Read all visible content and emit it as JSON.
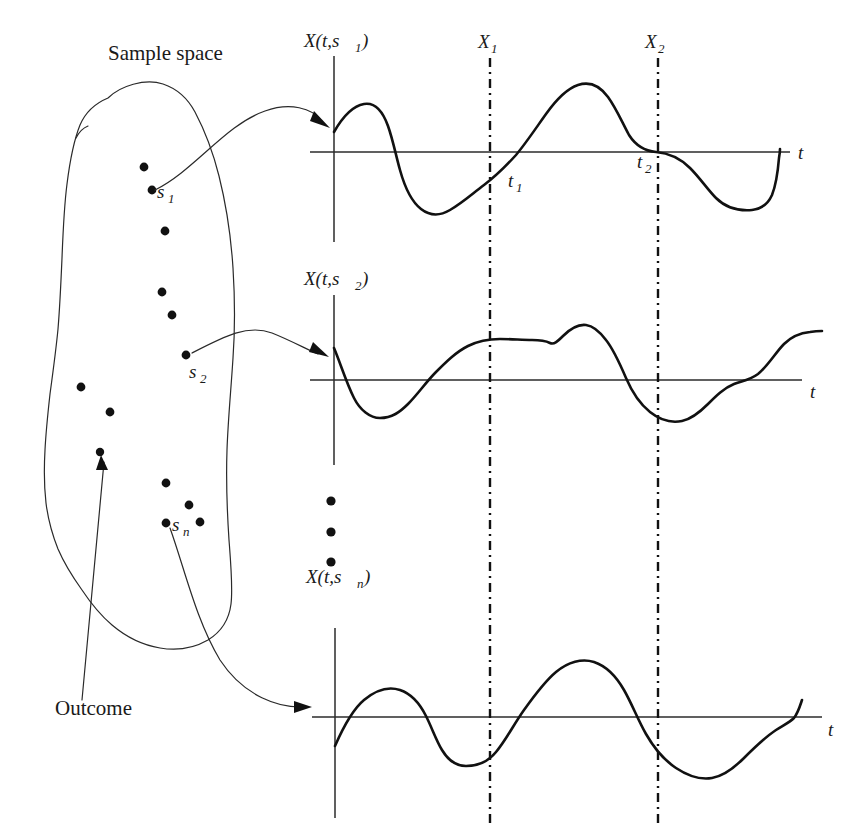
{
  "figure": {
    "type": "diagram",
    "background_color": "#ffffff",
    "ink_color": "#111111"
  },
  "labels": {
    "sample_space": "Sample space",
    "outcome": "Outcome",
    "s1": "s",
    "s1_sub": "1",
    "s2": "s",
    "s2_sub": "2",
    "sn": "s",
    "sn_sub": "n",
    "X1": "X",
    "X1_sub": "1",
    "X2": "X",
    "X2_sub": "2",
    "t1": "t",
    "t1_sub": "1",
    "t2": "t",
    "t2_sub": "2",
    "t_axis": "t",
    "wave1_head": "X(t,s",
    "wave1_sub": "1",
    "wave1_tail": ")",
    "wave2_head": "X(t,s",
    "wave2_sub": "2",
    "wave2_tail": ")",
    "wave3_head": "X(t,s",
    "wave3_sub": "n",
    "wave3_tail": ")"
  },
  "sample_space": {
    "outline_points": "Closed irregular blob enclosing outcome dots",
    "dot_count": 12,
    "dots": [
      {
        "name": "dot-1",
        "x": 144,
        "y": 167
      },
      {
        "name": "dot-s1",
        "x": 152,
        "y": 190,
        "label": "s1"
      },
      {
        "name": "dot-2",
        "x": 165,
        "y": 231
      },
      {
        "name": "dot-3",
        "x": 162,
        "y": 292
      },
      {
        "name": "dot-4",
        "x": 172,
        "y": 315
      },
      {
        "name": "dot-s2",
        "x": 186,
        "y": 355,
        "label": "s2"
      },
      {
        "name": "dot-5",
        "x": 81,
        "y": 387
      },
      {
        "name": "dot-6",
        "x": 110,
        "y": 412
      },
      {
        "name": "dot-7",
        "x": 100,
        "y": 452
      },
      {
        "name": "dot-8",
        "x": 166,
        "y": 483
      },
      {
        "name": "dot-9",
        "x": 189,
        "y": 505
      },
      {
        "name": "dot-sn",
        "x": 166,
        "y": 523,
        "label": "sn"
      },
      {
        "name": "dot-10",
        "x": 200,
        "y": 522
      }
    ]
  },
  "vertical_markers": [
    {
      "name": "X1",
      "label": "X",
      "sub": "1",
      "x": 490,
      "y_top": 58,
      "y_bottom": 826
    },
    {
      "name": "X2",
      "label": "X",
      "sub": "2",
      "x": 658,
      "y_top": 58,
      "y_bottom": 826
    }
  ],
  "waveforms": [
    {
      "name": "wave-s1",
      "label": "X(t,s1)",
      "axis_y": 152,
      "axis_x": 334,
      "axis_right": 790,
      "t_label": "t",
      "crossing_labels": [
        "t1",
        "t2"
      ]
    },
    {
      "name": "wave-s2",
      "label": "X(t,s2)",
      "axis_y": 380,
      "axis_x": 334,
      "axis_right": 800,
      "t_label": "t",
      "crossing_labels": []
    },
    {
      "name": "wave-sn",
      "label": "X(t,sn)",
      "axis_y": 717,
      "axis_x": 335,
      "axis_right": 820,
      "t_label": "t",
      "crossing_labels": []
    }
  ],
  "ellipsis": {
    "name": "vertical-ellipsis",
    "x": 331,
    "dots_y": [
      501,
      532,
      562
    ]
  }
}
